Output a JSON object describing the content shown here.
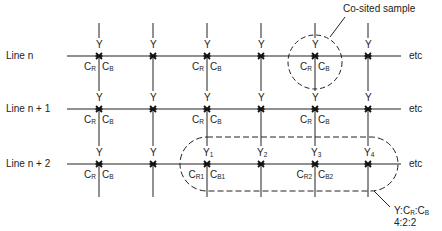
{
  "diagram": {
    "line_labels": [
      "Line n",
      "Line n + 1",
      "Line n + 2"
    ],
    "etc_label": "etc",
    "luma_label": "Y",
    "chroma_r": {
      "main": "C",
      "sub": "R"
    },
    "chroma_b": {
      "main": "C",
      "sub": "B"
    },
    "cosited_label": "Co-sited sample",
    "group_labels": {
      "y": [
        "1",
        "2",
        "3",
        "4"
      ],
      "cr": [
        "R1",
        "R2"
      ],
      "cb": [
        "B1",
        "B2"
      ]
    },
    "ratio_label_line1": "Y:C",
    "ratio_label_full": "Y:CR:CB",
    "ratio_value": "4:2:2",
    "colors": {
      "ink": "#222222",
      "background": "#ffffff"
    }
  }
}
